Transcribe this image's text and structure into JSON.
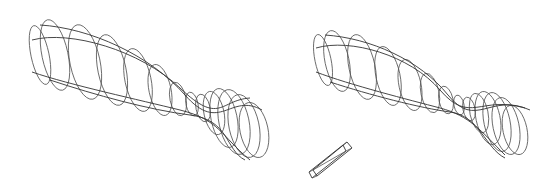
{
  "figure": {
    "stroke_color": "#555555",
    "background": "#ffffff"
  },
  "left_model": {
    "sections": [
      {
        "cx": 40,
        "cy": 55,
        "rx": 9,
        "ry": 30
      },
      {
        "cx": 55,
        "cy": 55,
        "rx": 13,
        "ry": 36
      },
      {
        "cx": 85,
        "cy": 62,
        "rx": 15,
        "ry": 38
      },
      {
        "cx": 112,
        "cy": 70,
        "rx": 14,
        "ry": 36
      },
      {
        "cx": 138,
        "cy": 80,
        "rx": 13,
        "ry": 32
      },
      {
        "cx": 160,
        "cy": 90,
        "rx": 11,
        "ry": 26
      },
      {
        "cx": 178,
        "cy": 99,
        "rx": 8,
        "ry": 17
      },
      {
        "cx": 192,
        "cy": 104,
        "rx": 6,
        "ry": 12
      },
      {
        "cx": 203,
        "cy": 108,
        "rx": 7,
        "ry": 14
      },
      {
        "cx": 214,
        "cy": 113,
        "rx": 10,
        "ry": 22
      },
      {
        "cx": 224,
        "cy": 118,
        "rx": 13,
        "ry": 30
      },
      {
        "cx": 234,
        "cy": 122,
        "rx": 15,
        "ry": 33
      },
      {
        "cx": 244,
        "cy": 126,
        "rx": 15,
        "ry": 32
      },
      {
        "cx": 254,
        "cy": 130,
        "rx": 14,
        "ry": 28
      }
    ],
    "rails": [
      "M32,40 C70,30 140,50 180,88 S220,100 250,98",
      "M32,72 C70,85 140,100 180,110 S220,135 250,160",
      "M40,25 C90,28 150,55 185,95 S230,92 262,110",
      "M50,80 C95,95 150,110 190,115 S225,150 245,160"
    ]
  },
  "right_model": {
    "sections": [
      {
        "cx": 323,
        "cy": 60,
        "rx": 8,
        "ry": 26
      },
      {
        "cx": 337,
        "cy": 61,
        "rx": 12,
        "ry": 31
      },
      {
        "cx": 362,
        "cy": 67,
        "rx": 13,
        "ry": 33
      },
      {
        "cx": 388,
        "cy": 76,
        "rx": 12,
        "ry": 30
      },
      {
        "cx": 410,
        "cy": 85,
        "rx": 11,
        "ry": 26
      },
      {
        "cx": 430,
        "cy": 93,
        "rx": 9,
        "ry": 20
      },
      {
        "cx": 446,
        "cy": 100,
        "rx": 7,
        "ry": 14
      },
      {
        "cx": 459,
        "cy": 105,
        "rx": 5,
        "ry": 10
      },
      {
        "cx": 469,
        "cy": 109,
        "rx": 6,
        "ry": 12
      },
      {
        "cx": 479,
        "cy": 113,
        "rx": 9,
        "ry": 20
      },
      {
        "cx": 488,
        "cy": 118,
        "rx": 12,
        "ry": 27
      },
      {
        "cx": 497,
        "cy": 122,
        "rx": 13,
        "ry": 30
      },
      {
        "cx": 506,
        "cy": 126,
        "rx": 13,
        "ry": 29
      },
      {
        "cx": 515,
        "cy": 130,
        "rx": 12,
        "ry": 25
      }
    ],
    "rails": [
      "M316,48 C350,38 410,55 440,90 S480,95 525,108",
      "M316,72 C350,85 410,100 440,108 S480,130 505,155",
      "M325,35 C370,38 420,60 448,95 S490,92 530,110",
      "M330,82 C370,95 420,108 450,112 S485,148 505,158"
    ]
  },
  "box": {
    "front": "M309,172 L343,145 L346,151 L312,178 Z",
    "back": "M313,170 L347,142 L352,148 L317,176 Z",
    "edges": [
      "M309,172 L313,170",
      "M343,145 L347,142",
      "M346,151 L352,148",
      "M312,178 L317,176",
      "M313,170 L346,151"
    ]
  }
}
